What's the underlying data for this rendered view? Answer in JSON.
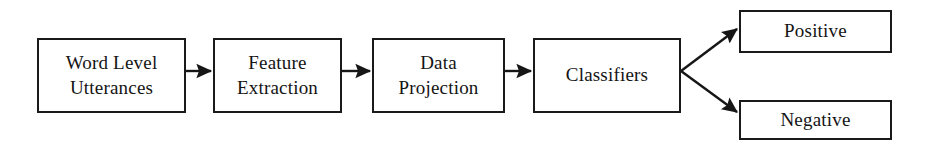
{
  "diagram": {
    "type": "flowchart",
    "background_color": "#ffffff",
    "stroke_color": "#1a1a1a",
    "text_color": "#141414",
    "nodes": [
      {
        "id": "word-level-utterances",
        "label": "Word Level\nUtterances",
        "x": 37,
        "y": 38,
        "w": 149,
        "h": 75
      },
      {
        "id": "feature-extraction",
        "label": "Feature\nExtraction",
        "x": 213,
        "y": 38,
        "w": 129,
        "h": 75
      },
      {
        "id": "data-projection",
        "label": "Data\nProjection",
        "x": 372,
        "y": 38,
        "w": 133,
        "h": 75
      },
      {
        "id": "classifiers",
        "label": "Classifiers",
        "x": 533,
        "y": 38,
        "w": 148,
        "h": 75
      },
      {
        "id": "positive",
        "label": "Positive",
        "x": 739,
        "y": 10,
        "w": 153,
        "h": 43
      },
      {
        "id": "negative",
        "label": "Negative",
        "x": 739,
        "y": 100,
        "w": 153,
        "h": 40
      }
    ],
    "edges": [
      {
        "id": "utterances-to-features",
        "from": "word-level-utterances",
        "to": "feature-extraction",
        "kind": "straight",
        "x1": 186,
        "y1": 71,
        "x2": 211,
        "y2": 71
      },
      {
        "id": "features-to-projection",
        "from": "feature-extraction",
        "to": "data-projection",
        "kind": "straight",
        "x1": 342,
        "y1": 71,
        "x2": 370,
        "y2": 71
      },
      {
        "id": "projection-to-classifiers",
        "from": "data-projection",
        "to": "classifiers",
        "kind": "straight",
        "x1": 505,
        "y1": 71,
        "x2": 531,
        "y2": 71
      },
      {
        "id": "classifiers-to-positive",
        "from": "classifiers",
        "to": "positive",
        "kind": "branch",
        "x1": 681,
        "y1": 71,
        "x2": 737,
        "y2": 29
      },
      {
        "id": "classifiers-to-negative",
        "from": "classifiers",
        "to": "negative",
        "kind": "branch",
        "x1": 681,
        "y1": 71,
        "x2": 737,
        "y2": 112
      }
    ]
  }
}
